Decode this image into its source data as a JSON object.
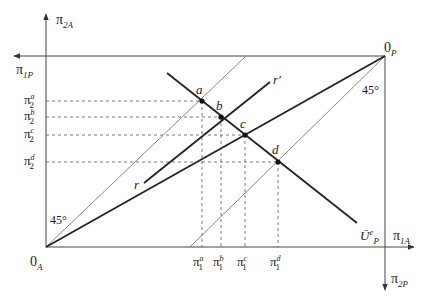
{
  "diagram": {
    "origin_A": "0",
    "origin_A_sub": "A",
    "origin_P": "0",
    "origin_P_sub": "P",
    "axes": {
      "pi2A": {
        "main": "π",
        "sub": "2A"
      },
      "pi1P": {
        "main": "π",
        "sub": "1P"
      },
      "pi1A": {
        "main": "π",
        "sub": "1A"
      },
      "pi2P": {
        "main": "π",
        "sub": "2P"
      }
    },
    "angle_labels": {
      "lower_left": "45°",
      "upper_right": "45°"
    },
    "points": [
      {
        "name": "a",
        "x": 202,
        "y": 101
      },
      {
        "name": "b",
        "x": 221,
        "y": 117
      },
      {
        "name": "c",
        "x": 245,
        "y": 135
      },
      {
        "name": "d",
        "x": 278,
        "y": 162
      }
    ],
    "curve_labels": {
      "r": "r",
      "r_prime": "r'",
      "utility_main": "Ū",
      "utility_sup": "e",
      "utility_sub": "P"
    },
    "y_ticks": [
      {
        "main": "π",
        "sub": "2",
        "sup": "a"
      },
      {
        "main": "π",
        "sub": "2",
        "sup": "b"
      },
      {
        "main": "π",
        "sub": "2",
        "sup": "c"
      },
      {
        "main": "π",
        "sub": "2",
        "sup": "d"
      }
    ],
    "x_ticks": [
      {
        "main": "π",
        "sub": "1",
        "sup": "a"
      },
      {
        "main": "π",
        "sub": "1",
        "sup": "b"
      },
      {
        "main": "π",
        "sub": "1",
        "sup": "c"
      },
      {
        "main": "π",
        "sub": "1",
        "sup": "d"
      }
    ]
  }
}
